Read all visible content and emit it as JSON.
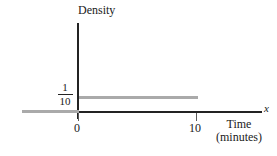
{
  "chart_data": {
    "type": "line",
    "title": "",
    "xlabel": "Time (minutes)",
    "ylabel": "Density",
    "x_axis_variable": "x",
    "xlim": [
      -5,
      14
    ],
    "ylim": [
      0,
      0.28
    ],
    "grid": false,
    "legend": null,
    "x_ticks": [
      "0",
      "10"
    ],
    "x_tick_values": [
      0,
      10
    ],
    "y_ticks": [
      "1/10"
    ],
    "y_tick_values": [
      0.1
    ],
    "series": [
      {
        "name": "Uniform density on [0, 10]",
        "x": [
          0,
          10
        ],
        "values": [
          0.1,
          0.1
        ],
        "color": "#aaaaaa"
      },
      {
        "name": "Zero density left of 0",
        "x": [
          -5,
          0
        ],
        "values": [
          0,
          0
        ],
        "color": "#aaaaaa"
      }
    ],
    "annotations": []
  },
  "axes": {
    "y_axis_label": "Density",
    "x_axis_variable": "x",
    "x_label_line_1": "Time",
    "x_label_line_2": "(minutes)"
  },
  "ticks": {
    "x_zero": "0",
    "x_ten": "10"
  },
  "density_value": {
    "numerator": "1",
    "denominator": "10"
  },
  "colors": {
    "axis": "#232323",
    "tick": "#5a5a5a",
    "density_line": "#aaaaaa",
    "background": "#ffffff",
    "text": "#1a1a1a"
  }
}
